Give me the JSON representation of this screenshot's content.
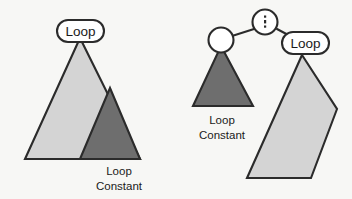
{
  "figure": {
    "background_color": "#f7f7f5",
    "outline_color": "#2b2b2b",
    "loop_body_fill": "#d4d4d4",
    "loop_constant_fill": "#6e6e6e",
    "node_fill": "#ffffff"
  },
  "left_diagram": {
    "name": "original-loop",
    "loop_label": "Loop",
    "constant_caption_line1": "Loop",
    "constant_caption_line2": "Constant"
  },
  "right_diagram": {
    "name": "hoisted-loop",
    "root_symbol": ":",
    "root_symbol_name": "vertical-ellipsis",
    "child_node_symbol": "",
    "loop_label": "Loop",
    "constant_caption_line1": "Loop",
    "constant_caption_line2": "Constant"
  }
}
